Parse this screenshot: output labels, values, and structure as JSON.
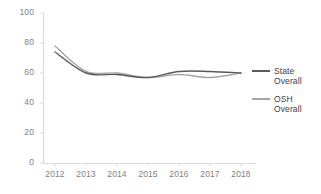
{
  "chart_data": {
    "type": "line",
    "title": "",
    "xlabel": "",
    "ylabel": "",
    "x": [
      2012,
      2013,
      2014,
      2015,
      2016,
      2017,
      2018
    ],
    "categories": [
      "2012",
      "2013",
      "2014",
      "2015",
      "2016",
      "2017",
      "2018"
    ],
    "series": [
      {
        "name": "State Overall",
        "color": "#595959",
        "values": [
          74,
          60,
          59,
          57,
          61,
          61,
          60
        ]
      },
      {
        "name": "OSH Overall",
        "color": "#a6a6a6",
        "values": [
          78,
          61,
          60,
          57,
          59,
          57,
          60
        ]
      }
    ],
    "ylim": [
      0,
      100
    ],
    "ytick_labels": [
      "0",
      "20",
      "40",
      "60",
      "80",
      "100"
    ],
    "ytick_values": [
      0,
      20,
      40,
      60,
      80,
      100
    ],
    "grid": false,
    "legend_position": "right"
  },
  "legend": {
    "entries": [
      {
        "label_line1": "State",
        "label_line2": "Overall"
      },
      {
        "label_line1": "OSH",
        "label_line2": "Overall"
      }
    ]
  },
  "colors": {
    "state_line": "#595959",
    "osh_line": "#a6a6a6",
    "axis": "#d9d9d9",
    "tick_text": "#7f7f7f",
    "legend_text": "#404040",
    "background": "#ffffff"
  }
}
